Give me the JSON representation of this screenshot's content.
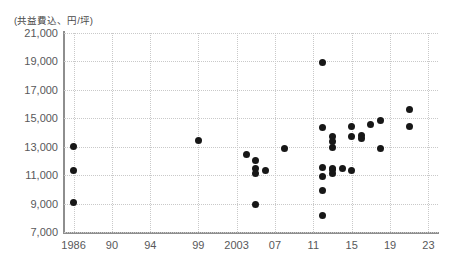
{
  "chart_data": {
    "type": "scatter",
    "title": "",
    "subtitle": "",
    "ylabel": "(共益費込、円/坪)",
    "xlabel": "",
    "xlim": [
      1985,
      2024
    ],
    "ylim": [
      7000,
      21000
    ],
    "grid": true,
    "legend": null,
    "xticks": [
      "1986",
      "90",
      "94",
      "99",
      "2003",
      "07",
      "11",
      "15",
      "19",
      "23"
    ],
    "xtick_values": [
      1986,
      1990,
      1994,
      1999,
      2003,
      2007,
      2011,
      2015,
      2019,
      2023
    ],
    "yticks": [
      "21,000",
      "19,000",
      "17,000",
      "15,000",
      "13,000",
      "11,000",
      "9,000",
      "7,000"
    ],
    "ytick_values": [
      21000,
      19000,
      17000,
      15000,
      13000,
      11000,
      9000,
      7000
    ],
    "marker": "filled-circle",
    "marker_color": "#171717",
    "points": [
      {
        "x": 1986,
        "y": 13000
      },
      {
        "x": 1986,
        "y": 11300
      },
      {
        "x": 1986,
        "y": 9100
      },
      {
        "x": 1999,
        "y": 13450
      },
      {
        "x": 2004,
        "y": 12450
      },
      {
        "x": 2005,
        "y": 12000
      },
      {
        "x": 2005,
        "y": 11500
      },
      {
        "x": 2005,
        "y": 11150
      },
      {
        "x": 2006,
        "y": 11350
      },
      {
        "x": 2005,
        "y": 8950
      },
      {
        "x": 2008,
        "y": 12900
      },
      {
        "x": 2012,
        "y": 18950
      },
      {
        "x": 2012,
        "y": 14350
      },
      {
        "x": 2013,
        "y": 13750
      },
      {
        "x": 2013,
        "y": 13350
      },
      {
        "x": 2013,
        "y": 12950
      },
      {
        "x": 2012,
        "y": 11550
      },
      {
        "x": 2013,
        "y": 11400
      },
      {
        "x": 2013,
        "y": 11150
      },
      {
        "x": 2013,
        "y": 11500
      },
      {
        "x": 2014,
        "y": 11450
      },
      {
        "x": 2012,
        "y": 10900
      },
      {
        "x": 2012,
        "y": 9950
      },
      {
        "x": 2012,
        "y": 8150
      },
      {
        "x": 2015,
        "y": 14450
      },
      {
        "x": 2015,
        "y": 13700
      },
      {
        "x": 2016,
        "y": 13800
      },
      {
        "x": 2016,
        "y": 13600
      },
      {
        "x": 2015,
        "y": 11300
      },
      {
        "x": 2017,
        "y": 14550
      },
      {
        "x": 2018,
        "y": 14850
      },
      {
        "x": 2018,
        "y": 12900
      },
      {
        "x": 2021,
        "y": 15600
      },
      {
        "x": 2021,
        "y": 14400
      }
    ]
  }
}
